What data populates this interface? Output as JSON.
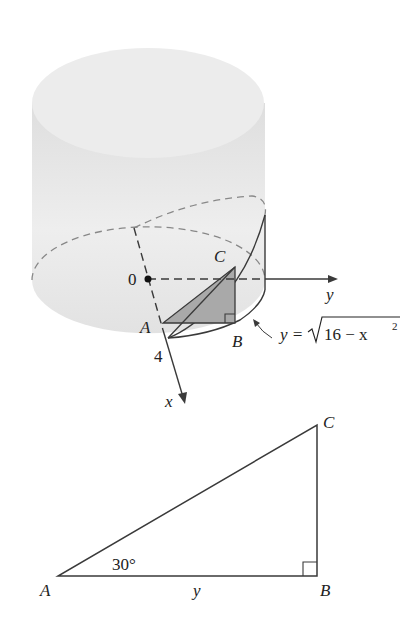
{
  "figure_top": {
    "title": "Cylinder with wedge cut",
    "labels": {
      "origin": "0",
      "y_axis": "y",
      "x_axis": "x",
      "tick_4": "4",
      "A": "A",
      "B": "B",
      "C": "C",
      "equation": "y = √16 − x²",
      "eq_prefix": "y =",
      "eq_radicand": "16 − x",
      "eq_exponent": "2"
    }
  },
  "figure_bottom": {
    "labels": {
      "A": "A",
      "B": "B",
      "C": "C",
      "side_AB": "y",
      "angle_A": "30°"
    }
  },
  "colors": {
    "line": "#3a3a3a",
    "cylinder_fill": "#e4e4e4",
    "shaded_triangle": "#a9a9a9",
    "dashed": "#888888"
  }
}
